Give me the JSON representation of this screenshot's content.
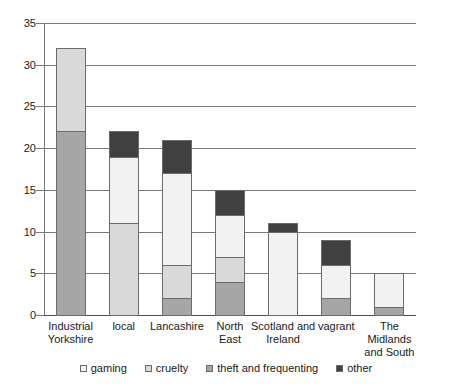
{
  "chart_data": {
    "type": "bar",
    "stacked": true,
    "title": "",
    "subtitle": "",
    "xlabel": "",
    "ylabel": "",
    "ylim": [
      0,
      35
    ],
    "ytick_values": [
      0,
      5,
      10,
      15,
      20,
      25,
      30,
      35
    ],
    "ytick_labels": [
      "0",
      "5",
      "10",
      "15",
      "20",
      "25",
      "30",
      "35"
    ],
    "grid": true,
    "legend_position": "bottom",
    "categories": [
      "Industrial Yorkshire",
      "local",
      "Lancashire",
      "North East",
      "Scotland and Ireland",
      "vagrant",
      "The Midlands and South"
    ],
    "category_lines": [
      [
        "Industrial",
        "Yorkshire"
      ],
      [
        "local"
      ],
      [
        "Lancashire"
      ],
      [
        "North",
        "East"
      ],
      [
        "Scotland and",
        "Ireland"
      ],
      [
        "vagrant"
      ],
      [
        "The Midlands",
        "and South"
      ]
    ],
    "series": [
      {
        "name": "gaming",
        "color": "#f2f2f2",
        "values": [
          0,
          8,
          11,
          5,
          10,
          4,
          4
        ]
      },
      {
        "name": "cruelty",
        "color": "#d9d9d9",
        "values": [
          10,
          11,
          4,
          3,
          0,
          0,
          0
        ]
      },
      {
        "name": "theft and frequenting",
        "color": "#a6a6a6",
        "values": [
          22,
          0,
          2,
          4,
          0,
          2,
          1
        ]
      },
      {
        "name": "other",
        "color": "#404040",
        "values": [
          0,
          3,
          4,
          3,
          1,
          3,
          0
        ]
      }
    ],
    "stack_order": [
      "theft and frequenting",
      "cruelty",
      "gaming",
      "other"
    ],
    "totals": [
      32,
      22,
      21,
      15,
      11,
      9,
      5
    ],
    "colors": {
      "gridline": "#7a7a7a",
      "axis": "#7a7a7a",
      "segment_border": "#6b6b6b",
      "text": "#1a1a1a",
      "background": "#ffffff"
    }
  }
}
